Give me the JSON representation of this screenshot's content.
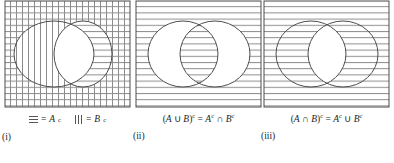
{
  "figure": {
    "type": "venn-diagram-set",
    "stroke_color": "#4d4d4d",
    "hatch_color": "#8c8c8c",
    "text_color": "#231f20",
    "background_color": "#ffffff"
  },
  "panels": [
    {
      "id": "i",
      "roman_label": "(i)",
      "caption": "",
      "shading": {
        "outside_both": "cross-hatch (horizontal + vertical)",
        "inside_A_only": "vertical lines",
        "inside_B_only": "horizontal lines",
        "intersection": "unshaded"
      },
      "legend": [
        {
          "swatch": "horizontal-lines-swatch",
          "equals": "=",
          "label": "A",
          "superscript": "c"
        },
        {
          "swatch": "vertical-lines-swatch",
          "equals": "=",
          "label": "B",
          "superscript": "c"
        }
      ]
    },
    {
      "id": "ii",
      "roman_label": "(ii)",
      "caption_parts": {
        "open": "(",
        "set_a": "A",
        "operator": " ∪ ",
        "set_b": "B",
        "close": ")",
        "sup_left": "c",
        "equals": " = ",
        "rhs_a": "A",
        "rhs_a_sup": "c",
        "rhs_op": " ∩ ",
        "rhs_b": "B",
        "rhs_b_sup": "c"
      },
      "caption_text": "(A ∪ B)c = Ac ∩ Bc",
      "shading": {
        "outside_both": "horizontal lines",
        "inside_A_only": "unshaded",
        "inside_B_only": "unshaded",
        "intersection": "unshaded"
      },
      "legend": []
    },
    {
      "id": "iii",
      "roman_label": "(iii)",
      "caption_parts": {
        "open": "(",
        "set_a": "A",
        "operator": " ∩ ",
        "set_b": "B",
        "close": ")",
        "sup_left": "c",
        "equals": " = ",
        "rhs_a": "A",
        "rhs_a_sup": "c",
        "rhs_op": " ∪ ",
        "rhs_b": "B",
        "rhs_b_sup": "c"
      },
      "caption_text": "(A ∩ B)c = Ac ∪ Bc",
      "shading": {
        "outside_both": "horizontal lines",
        "inside_A_only": "horizontal lines",
        "inside_B_only": "horizontal lines",
        "intersection": "unshaded"
      },
      "legend": []
    }
  ]
}
